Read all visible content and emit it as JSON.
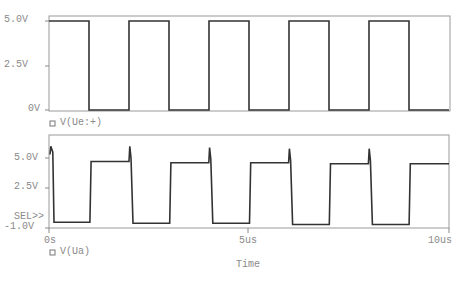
{
  "chart_data": [
    {
      "type": "line",
      "title": "",
      "legend": [
        {
          "name": "V(Ue:+)",
          "marker": "square"
        }
      ],
      "xlabel": "Time",
      "ylabel": "",
      "xlim": [
        0,
        10
      ],
      "x_unit": "us",
      "ylim": [
        0,
        5.0
      ],
      "ytick_labels": [
        "5.0V",
        "2.5V",
        "0V"
      ],
      "yticks": [
        5.0,
        2.5,
        0
      ],
      "series": [
        {
          "name": "V(Ue:+)",
          "x": [
            0,
            1.0,
            1.0,
            2.0,
            2.0,
            3.0,
            3.0,
            4.0,
            4.0,
            5.0,
            5.0,
            6.0,
            6.0,
            7.0,
            7.0,
            8.0,
            8.0,
            9.0,
            9.0,
            10.0
          ],
          "y": [
            5.0,
            5.0,
            0,
            0,
            5.0,
            5.0,
            0,
            0,
            5.0,
            5.0,
            0,
            0,
            5.0,
            5.0,
            0,
            0,
            5.0,
            5.0,
            0,
            0
          ]
        }
      ]
    },
    {
      "type": "line",
      "title": "",
      "legend": [
        {
          "name": "V(Ua)",
          "marker": "square"
        }
      ],
      "xlabel": "Time",
      "ylabel": "",
      "xlim": [
        0,
        10
      ],
      "x_unit": "us",
      "ylim": [
        -1.0,
        6.5
      ],
      "ytick_labels": [
        "5.0V",
        "2.5V",
        "SEL>>",
        "-1.0V"
      ],
      "yticks": [
        5.0,
        2.5,
        -1.0
      ],
      "xtick_labels": [
        "0s",
        "5us",
        "10us"
      ],
      "xticks": [
        0,
        5,
        10
      ],
      "series": [
        {
          "name": "V(Ua)",
          "x": [
            0,
            0.02,
            0.07,
            0.1,
            1.0,
            1.03,
            1.98,
            2.0,
            2.03,
            2.08,
            3.0,
            3.03,
            3.98,
            4.0,
            4.03,
            4.08,
            5.0,
            5.03,
            5.98,
            6.0,
            6.03,
            6.08,
            7.0,
            7.03,
            7.98,
            8.0,
            8.03,
            8.08,
            9.0,
            9.03,
            10.0
          ],
          "y": [
            5.3,
            6.0,
            5.5,
            -0.5,
            -0.5,
            4.7,
            4.7,
            6.0,
            5.0,
            -0.6,
            -0.6,
            4.6,
            4.6,
            5.9,
            4.9,
            -0.6,
            -0.6,
            4.6,
            4.6,
            5.8,
            4.8,
            -0.7,
            -0.7,
            4.5,
            4.5,
            5.8,
            4.8,
            -0.7,
            -0.7,
            4.5,
            4.5
          ]
        }
      ]
    }
  ],
  "top_plot": {
    "yticks": [
      "5.0V",
      "2.5V",
      "0V"
    ],
    "legend": "V(Ue:+)"
  },
  "bottom_plot": {
    "yticks": [
      "5.0V",
      "2.5V",
      "-1.0V"
    ],
    "sel_marker": "SEL>>",
    "legend": "V(Ua)"
  },
  "x_axis": {
    "ticks": [
      "0s",
      "5us",
      "10us"
    ],
    "label": "Time"
  }
}
